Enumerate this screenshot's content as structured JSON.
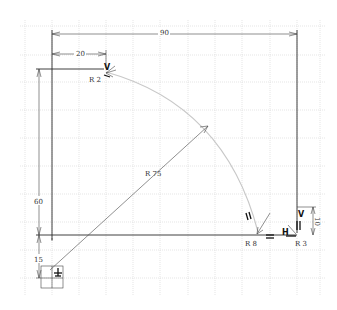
{
  "sketch": {
    "background": "#ffffff",
    "grid_color": "#d4d4d4",
    "geometry_color": "#2a2a2a",
    "arc_color": "#c8c8c8",
    "dimensions": {
      "width_overall": "90",
      "offset_top": "20",
      "height_left": "60",
      "offset_bottom": "15",
      "height_right": "10"
    },
    "radii": {
      "arc_large": "R 75",
      "fillet_top_left": "R 2",
      "fillet_bottom": "R 8",
      "fillet_bottom_right": "R 3"
    },
    "constraints": {
      "vertical_top": "V",
      "vertical_right": "V",
      "horizontal_bottom": "H",
      "parallel_arc": "//",
      "parallel_right": "//",
      "equal_bottom": "=",
      "origin_fixed": "fix-icon"
    }
  }
}
